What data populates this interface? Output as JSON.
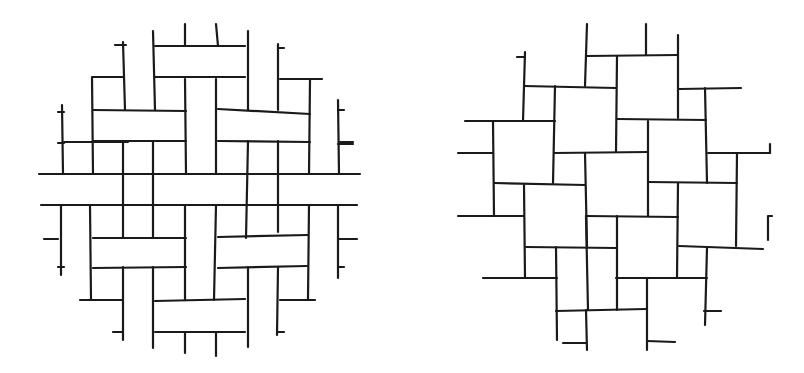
{
  "figures": [
    {
      "name": "basket-weave-pattern",
      "stroke": "#1a1a1a",
      "segments": [
        [
          155,
          46,
          245,
          46
        ],
        [
          155,
          77,
          245,
          77
        ],
        [
          93,
          77,
          123,
          77
        ],
        [
          280,
          79,
          322,
          79
        ],
        [
          93,
          110,
          186,
          111
        ],
        [
          218,
          109,
          310,
          114
        ],
        [
          64,
          142,
          128,
          142
        ],
        [
          93,
          141,
          186,
          141
        ],
        [
          218,
          141,
          310,
          142
        ],
        [
          340,
          142,
          353,
          142
        ],
        [
          39,
          174,
          360,
          174
        ],
        [
          41,
          205,
          357,
          205
        ],
        [
          93,
          238,
          186,
          238
        ],
        [
          218,
          237,
          308,
          235
        ],
        [
          93,
          268,
          186,
          267
        ],
        [
          218,
          268,
          307,
          266
        ],
        [
          80,
          300,
          123,
          300
        ],
        [
          280,
          300,
          315,
          300
        ],
        [
          155,
          301,
          245,
          299
        ],
        [
          155,
          332,
          245,
          332
        ],
        [
          115,
          45,
          126,
          45
        ],
        [
          278,
          48,
          284,
          48
        ],
        [
          58,
          112,
          64,
          112
        ],
        [
          338,
          110,
          344,
          110
        ],
        [
          58,
          143,
          64,
          143
        ],
        [
          338,
          144,
          353,
          144
        ],
        [
          44,
          239,
          58,
          239
        ],
        [
          338,
          239,
          357,
          239
        ],
        [
          58,
          267,
          64,
          267
        ],
        [
          338,
          267,
          344,
          267
        ],
        [
          113,
          332,
          122,
          332
        ],
        [
          278,
          332,
          284,
          332
        ],
        [
          123,
          42,
          125,
          110
        ],
        [
          153,
          31,
          155,
          110
        ],
        [
          185,
          24,
          185,
          46
        ],
        [
          216,
          24,
          218,
          46
        ],
        [
          248,
          31,
          248,
          110
        ],
        [
          278,
          44,
          278,
          110
        ],
        [
          92,
          77,
          93,
          174
        ],
        [
          62,
          105,
          63,
          174
        ],
        [
          310,
          80,
          309,
          174
        ],
        [
          338,
          100,
          339,
          174
        ],
        [
          185,
          79,
          186,
          174
        ],
        [
          216,
          79,
          216,
          174
        ],
        [
          123,
          141,
          123,
          238
        ],
        [
          153,
          141,
          153,
          238
        ],
        [
          248,
          141,
          246,
          238
        ],
        [
          278,
          141,
          278,
          232
        ],
        [
          61,
          205,
          61,
          275
        ],
        [
          90,
          205,
          91,
          300
        ],
        [
          309,
          205,
          308,
          299
        ],
        [
          338,
          205,
          338,
          278
        ],
        [
          185,
          205,
          185,
          300
        ],
        [
          216,
          205,
          214,
          300
        ],
        [
          123,
          267,
          123,
          340
        ],
        [
          153,
          267,
          153,
          348
        ],
        [
          248,
          267,
          248,
          347
        ],
        [
          278,
          267,
          277,
          335
        ],
        [
          185,
          332,
          185,
          353
        ],
        [
          216,
          332,
          216,
          356
        ]
      ]
    },
    {
      "name": "pinwheel-square-pattern",
      "stroke": "#1a1a1a",
      "segments": [
        [
          587,
          56,
          678,
          55
        ],
        [
          524,
          86,
          616,
          88
        ],
        [
          679,
          89,
          741,
          88
        ],
        [
          465,
          121,
          555,
          121
        ],
        [
          617,
          119,
          706,
          120
        ],
        [
          458,
          153,
          493,
          153
        ],
        [
          554,
          153,
          648,
          152
        ],
        [
          708,
          153,
          770,
          153
        ],
        [
          494,
          183,
          585,
          185
        ],
        [
          648,
          182,
          737,
          183
        ],
        [
          458,
          216,
          524,
          216
        ],
        [
          586,
          216,
          678,
          217
        ],
        [
          526,
          247,
          616,
          248
        ],
        [
          679,
          246,
          763,
          249
        ],
        [
          483,
          278,
          557,
          278
        ],
        [
          616,
          278,
          707,
          278
        ],
        [
          556,
          311,
          646,
          309
        ],
        [
          563,
          343,
          586,
          343
        ],
        [
          647,
          341,
          675,
          342
        ],
        [
          704,
          311,
          721,
          311
        ],
        [
          517,
          57,
          525,
          57
        ],
        [
          769,
          216,
          772,
          216
        ],
        [
          587,
          24,
          585,
          86
        ],
        [
          646,
          24,
          646,
          55
        ],
        [
          678,
          35,
          678,
          118
        ],
        [
          525,
          52,
          523,
          121
        ],
        [
          555,
          86,
          553,
          183
        ],
        [
          617,
          56,
          616,
          152
        ],
        [
          493,
          121,
          494,
          216
        ],
        [
          585,
          153,
          587,
          246
        ],
        [
          648,
          121,
          648,
          216
        ],
        [
          705,
          88,
          707,
          183
        ],
        [
          737,
          153,
          736,
          246
        ],
        [
          770,
          144,
          770,
          153
        ],
        [
          524,
          185,
          525,
          278
        ],
        [
          556,
          247,
          557,
          340
        ],
        [
          586,
          216,
          588,
          310
        ],
        [
          617,
          216,
          617,
          310
        ],
        [
          678,
          183,
          677,
          278
        ],
        [
          647,
          278,
          647,
          350
        ],
        [
          707,
          248,
          705,
          325
        ],
        [
          768,
          216,
          768,
          240
        ],
        [
          586,
          310,
          587,
          350
        ]
      ]
    }
  ]
}
